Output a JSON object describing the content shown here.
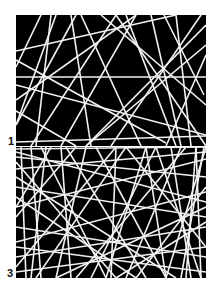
{
  "figure": {
    "background": "#ffffff",
    "panel_color": "#000000",
    "line_color": "#f2f2f2",
    "panels": [
      {
        "label": "1",
        "density": "sparse",
        "lines": [
          [
            0,
            36,
            160,
            0
          ],
          [
            0,
            62,
            190,
            62
          ],
          [
            0,
            45,
            150,
            128
          ],
          [
            0,
            96,
            60,
            131
          ],
          [
            0,
            127,
            190,
            121
          ],
          [
            25,
            0,
            0,
            52
          ],
          [
            40,
            0,
            0,
            110
          ],
          [
            55,
            0,
            75,
            131
          ],
          [
            65,
            0,
            125,
            131
          ],
          [
            0,
            85,
            120,
            0
          ],
          [
            15,
            131,
            100,
            0
          ],
          [
            85,
            0,
            190,
            90
          ],
          [
            100,
            0,
            190,
            131
          ],
          [
            110,
            0,
            160,
            131
          ],
          [
            120,
            0,
            45,
            131
          ],
          [
            135,
            0,
            165,
            131
          ],
          [
            148,
            0,
            188,
            80
          ],
          [
            160,
            0,
            175,
            131
          ],
          [
            185,
            0,
            95,
            131
          ],
          [
            190,
            10,
            70,
            131
          ],
          [
            190,
            40,
            150,
            131
          ],
          [
            0,
            110,
            60,
            0
          ],
          [
            20,
            131,
            35,
            0
          ],
          [
            0,
            70,
            190,
            120
          ],
          [
            70,
            131,
            190,
            30
          ]
        ]
      },
      {
        "label": "3",
        "density": "dense",
        "lines": [
          [
            0,
            2,
            190,
            0
          ],
          [
            0,
            10,
            190,
            30
          ],
          [
            0,
            22,
            190,
            5
          ],
          [
            0,
            40,
            190,
            70
          ],
          [
            0,
            60,
            190,
            12
          ],
          [
            0,
            80,
            190,
            110
          ],
          [
            0,
            95,
            190,
            45
          ],
          [
            0,
            110,
            190,
            80
          ],
          [
            0,
            125,
            190,
            100
          ],
          [
            0,
            50,
            120,
            131
          ],
          [
            0,
            30,
            160,
            131
          ],
          [
            0,
            70,
            60,
            0
          ],
          [
            0,
            120,
            100,
            0
          ],
          [
            5,
            0,
            10,
            131
          ],
          [
            15,
            0,
            25,
            131
          ],
          [
            25,
            0,
            90,
            131
          ],
          [
            30,
            0,
            15,
            131
          ],
          [
            45,
            0,
            55,
            131
          ],
          [
            50,
            0,
            130,
            131
          ],
          [
            60,
            131,
            170,
            0
          ],
          [
            70,
            0,
            40,
            131
          ],
          [
            80,
            0,
            150,
            131
          ],
          [
            90,
            131,
            130,
            0
          ],
          [
            100,
            0,
            95,
            131
          ],
          [
            110,
            0,
            190,
            100
          ],
          [
            120,
            131,
            190,
            40
          ],
          [
            130,
            0,
            150,
            131
          ],
          [
            140,
            0,
            75,
            131
          ],
          [
            150,
            131,
            190,
            0
          ],
          [
            155,
            0,
            175,
            131
          ],
          [
            165,
            0,
            110,
            131
          ],
          [
            170,
            131,
            180,
            0
          ],
          [
            180,
            0,
            185,
            131
          ],
          [
            185,
            131,
            140,
            0
          ],
          [
            188,
            0,
            165,
            131
          ],
          [
            0,
            15,
            100,
            131
          ],
          [
            20,
            131,
            110,
            0
          ],
          [
            40,
            131,
            190,
            60
          ],
          [
            0,
            100,
            190,
            125
          ],
          [
            0,
            5,
            190,
            55
          ],
          [
            35,
            0,
            0,
            60
          ],
          [
            190,
            75,
            100,
            131
          ]
        ]
      }
    ]
  }
}
